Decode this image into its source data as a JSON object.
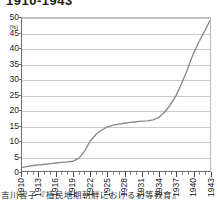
{
  "figure": {
    "title": "1910-1943",
    "caption": "吉川容子『植民地期朝鮮における初等教育』",
    "source_label": "吉川容子『植民地期朝鮮における初等教育』"
  },
  "chart_data": {
    "type": "line",
    "title": "1910-1943",
    "xlabel": "",
    "ylabel": "(%)",
    "yunit": "(%)",
    "xlim": [
      1910,
      1943
    ],
    "ylim": [
      0,
      50
    ],
    "grid": true,
    "legend": "none",
    "line_color": "#8a8a8a",
    "y_ticks": [
      0,
      5,
      10,
      15,
      20,
      25,
      30,
      35,
      40,
      45,
      50
    ],
    "x_ticks": [
      1910,
      1913,
      1916,
      1919,
      1922,
      1925,
      1928,
      1931,
      1934,
      1937,
      1940,
      1943
    ],
    "x_minor_ticks": [
      1911,
      1912,
      1914,
      1915,
      1917,
      1918,
      1920,
      1921,
      1923,
      1924,
      1926,
      1927,
      1929,
      1930,
      1932,
      1933,
      1935,
      1936,
      1938,
      1939,
      1941,
      1942
    ],
    "x": [
      1910,
      1911,
      1912,
      1913,
      1914,
      1915,
      1916,
      1917,
      1918,
      1919,
      1920,
      1921,
      1922,
      1923,
      1924,
      1925,
      1926,
      1927,
      1928,
      1929,
      1930,
      1931,
      1932,
      1933,
      1934,
      1935,
      1936,
      1937,
      1938,
      1939,
      1940,
      1941,
      1942,
      1943
    ],
    "values": [
      1.2,
      1.5,
      1.8,
      2.0,
      2.2,
      2.4,
      2.6,
      2.8,
      3.0,
      3.2,
      4.2,
      6.5,
      9.8,
      12.0,
      13.4,
      14.4,
      15.0,
      15.3,
      15.6,
      15.9,
      16.1,
      16.3,
      16.4,
      16.7,
      17.5,
      19.2,
      21.5,
      24.5,
      28.5,
      33.0,
      38.0,
      42.0,
      45.5,
      49.2
    ],
    "series": [
      {
        "name": "就学率",
        "values": [
          1.2,
          1.5,
          1.8,
          2.0,
          2.2,
          2.4,
          2.6,
          2.8,
          3.0,
          3.2,
          4.2,
          6.5,
          9.8,
          12.0,
          13.4,
          14.4,
          15.0,
          15.3,
          15.6,
          15.9,
          16.1,
          16.3,
          16.4,
          16.7,
          17.5,
          19.2,
          21.5,
          24.5,
          28.5,
          33.0,
          38.0,
          42.0,
          45.5,
          49.2
        ]
      }
    ]
  }
}
